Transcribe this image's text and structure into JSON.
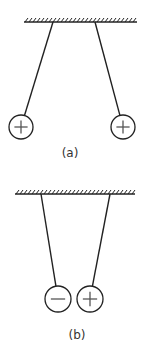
{
  "panels": [
    {
      "id": "a",
      "label": "(a)",
      "description": "Two like-charged spheres repel",
      "support": {
        "x1": 24,
        "x2": 137,
        "y": 22
      },
      "spheres": [
        {
          "charge": "+",
          "cx": 21,
          "cy": 127,
          "r": 12,
          "attach_x": 53
        },
        {
          "charge": "+",
          "cx": 123,
          "cy": 127,
          "r": 12,
          "attach_x": 95
        }
      ],
      "label_pos": {
        "x": 70,
        "y": 157
      }
    },
    {
      "id": "b",
      "label": "(b)",
      "description": "Oppositely charged spheres attract",
      "support": {
        "x1": 15,
        "x2": 135,
        "y": 194
      },
      "spheres": [
        {
          "charge": "−",
          "cx": 58,
          "cy": 299,
          "r": 13,
          "attach_x": 41
        },
        {
          "charge": "+",
          "cx": 90,
          "cy": 299,
          "r": 13,
          "attach_x": 110
        }
      ],
      "label_pos": {
        "x": 77,
        "y": 339
      }
    }
  ],
  "colors": {
    "line": "#222222",
    "sign": "#555555"
  }
}
